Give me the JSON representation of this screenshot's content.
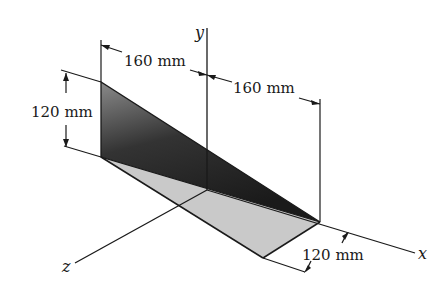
{
  "diagram": {
    "type": "3d-engineering-figure",
    "axes": {
      "x_label": "x",
      "y_label": "y",
      "z_label": "z"
    },
    "dimensions": {
      "top_left": "160 mm",
      "top_right": "160 mm",
      "height": "120 mm",
      "depth": "120 mm"
    },
    "colors": {
      "dark_plate_start": "#777777",
      "dark_plate_end": "#1e1e1e",
      "light_plate": "#c8c8c8",
      "line": "#1a1a1a"
    }
  }
}
